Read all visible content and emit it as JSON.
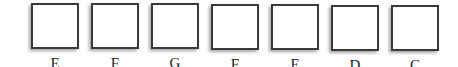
{
  "diagram": {
    "type": "labeled-boxes-row",
    "box_count": 7,
    "border_color": "#3a3a3a",
    "fill_color": "#ffffff",
    "items": [
      {
        "label": "E",
        "left": 31,
        "top": 3
      },
      {
        "label": "F",
        "left": 91,
        "top": 3
      },
      {
        "label": "G",
        "left": 151,
        "top": 3
      },
      {
        "label": "F",
        "left": 211,
        "top": 4
      },
      {
        "label": "E",
        "left": 271,
        "top": 4
      },
      {
        "label": "D",
        "left": 331,
        "top": 5
      },
      {
        "label": "C",
        "left": 391,
        "top": 5
      }
    ]
  }
}
